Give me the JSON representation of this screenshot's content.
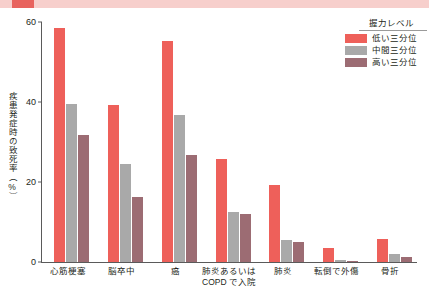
{
  "top_band": {
    "band_color": "#f7cfcc",
    "accent_color": "#e8635e"
  },
  "legend": {
    "title": "握力レベル",
    "items": [
      {
        "label": "低い三分位",
        "color": "#ee605a"
      },
      {
        "label": "中間三分位",
        "color": "#a9a9a9"
      },
      {
        "label": "高い三分位",
        "color": "#9c6c73"
      }
    ]
  },
  "axis": {
    "y_title": "疾患発症時の致死率（%）",
    "y_ticks": [
      "0",
      "20",
      "40",
      "60"
    ]
  },
  "chart_data": {
    "type": "bar",
    "title": "",
    "subtitle": "",
    "xlabel": "",
    "ylabel": "疾患発症時の致死率（%）",
    "ylim": [
      0,
      60
    ],
    "yticks": [
      0,
      20,
      40,
      60
    ],
    "grid": false,
    "legend_position": "top-right",
    "legend_title": "握力レベル",
    "categories": [
      "心筋梗塞",
      "脳卒中",
      "癌",
      "肺炎あるいは\nCOPD で入院",
      "肺炎",
      "転倒で外傷",
      "骨折"
    ],
    "series": [
      {
        "name": "低い三分位",
        "color": "#ee605a",
        "values": [
          58.5,
          39.2,
          55.3,
          25.8,
          19.3,
          3.6,
          5.7
        ]
      },
      {
        "name": "中間三分位",
        "color": "#a9a9a9",
        "values": [
          39.6,
          24.5,
          36.8,
          12.6,
          5.4,
          0.5,
          2.1
        ]
      },
      {
        "name": "高い三分位",
        "color": "#9c6c73",
        "values": [
          31.7,
          16.2,
          26.7,
          12.0,
          5.0,
          0.3,
          1.2
        ]
      }
    ]
  }
}
